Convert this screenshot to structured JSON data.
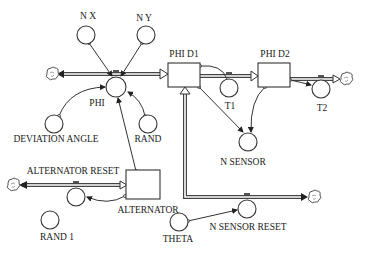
{
  "diagram": {
    "type": "stock-and-flow",
    "stocks": [
      {
        "id": "phi_d1",
        "label": "PHI D1"
      },
      {
        "id": "phi_d2",
        "label": "PHI D2"
      },
      {
        "id": "alternator",
        "label": "ALTERNATOR"
      }
    ],
    "flows": [
      {
        "id": "phi",
        "label": "PHI"
      },
      {
        "id": "t1",
        "label": "T1"
      },
      {
        "id": "t2",
        "label": "T2"
      },
      {
        "id": "alternator_reset",
        "label": "ALTERNATOR RESET"
      },
      {
        "id": "n_sensor_reset",
        "label": "N SENSOR RESET"
      }
    ],
    "converters": [
      {
        "id": "n_x",
        "label": "N X"
      },
      {
        "id": "n_y",
        "label": "N Y"
      },
      {
        "id": "deviation_angle",
        "label": "DEVIATION ANGLE"
      },
      {
        "id": "rand",
        "label": "RAND"
      },
      {
        "id": "n_sensor",
        "label": "N SENSOR"
      },
      {
        "id": "rand_1",
        "label": "RAND 1"
      },
      {
        "id": "theta",
        "label": "THETA"
      }
    ],
    "links": [
      {
        "from": "N X",
        "to": "PHI"
      },
      {
        "from": "N Y",
        "to": "PHI"
      },
      {
        "from": "DEVIATION ANGLE",
        "to": "PHI"
      },
      {
        "from": "RAND",
        "to": "PHI"
      },
      {
        "from": "ALTERNATOR",
        "to": "PHI"
      },
      {
        "from": "PHI D1",
        "to": "T1"
      },
      {
        "from": "PHI D1",
        "to": "N SENSOR"
      },
      {
        "from": "PHI D2",
        "to": "N SENSOR"
      },
      {
        "from": "PHI D2",
        "to": "T2"
      },
      {
        "from": "ALTERNATOR",
        "to": "ALTERNATOR RESET"
      },
      {
        "from": "THETA",
        "to": "N SENSOR RESET"
      }
    ],
    "pipes": [
      {
        "from": "PHI D1",
        "to": "cloud-left",
        "via": "PHI"
      },
      {
        "from": "PHI D1",
        "to": "PHI D2",
        "via": "T1"
      },
      {
        "from": "PHI D2",
        "to": "cloud-right",
        "via": "T2"
      },
      {
        "from": "ALTERNATOR",
        "to": "cloud-alt",
        "via": "ALTERNATOR RESET"
      },
      {
        "from": "cloud-sensor",
        "to": "PHI D1",
        "via": "N SENSOR RESET"
      }
    ]
  }
}
